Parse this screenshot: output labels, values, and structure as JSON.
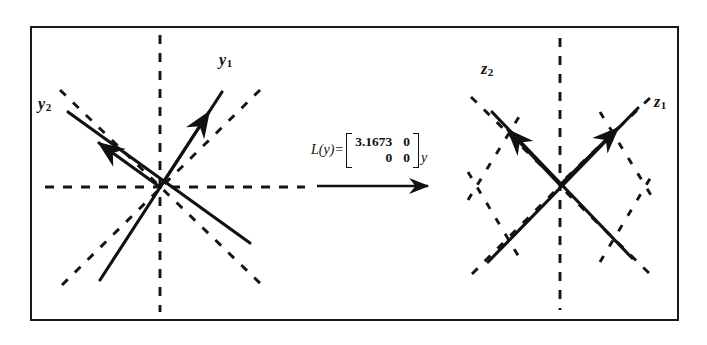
{
  "figure": {
    "type": "linear-transformation-diagram",
    "border_color": "#1a1a1a",
    "ink_color": "#111111"
  },
  "formula": {
    "function_label": "L(y)",
    "equals": "=",
    "matrix": [
      [
        "3.1673",
        "0"
      ],
      [
        "0",
        "0"
      ]
    ],
    "operand": "y"
  },
  "left_diagram": {
    "name": "y-space",
    "center": [
      160,
      187
    ],
    "labels": [
      {
        "id": "y1",
        "base": "y",
        "sub": "1",
        "x": 219,
        "y": 52
      },
      {
        "id": "y2",
        "base": "y",
        "sub": "2",
        "x": 38,
        "y": 96
      }
    ],
    "dashed_lines": [
      {
        "name": "horizontal-axis",
        "x1": 45,
        "y1": 187,
        "x2": 305,
        "y2": 187
      },
      {
        "name": "vertical-axis",
        "x1": 160,
        "y1": 35,
        "x2": 160,
        "y2": 312
      },
      {
        "name": "diagonal-up-right",
        "x1": 62,
        "y1": 285,
        "x2": 262,
        "y2": 88
      },
      {
        "name": "diagonal-up-left",
        "x1": 60,
        "y1": 90,
        "x2": 265,
        "y2": 288
      }
    ],
    "vectors": [
      {
        "name": "y1-vector",
        "x1": 160,
        "y1": 187,
        "x2": 222,
        "y2": 92,
        "arrow_at": [
          205,
          118
        ]
      },
      {
        "name": "y2-vector",
        "x1": 160,
        "y1": 187,
        "x2": 68,
        "y2": 112,
        "arrow_at": [
          95,
          134
        ]
      },
      {
        "name": "y1-vector-opposite",
        "x1": 160,
        "y1": 187,
        "x2": 100,
        "y2": 280
      },
      {
        "name": "y2-vector-opposite",
        "x1": 160,
        "y1": 187,
        "x2": 250,
        "y2": 243
      }
    ]
  },
  "right_diagram": {
    "name": "z-space",
    "center": [
      560,
      185
    ],
    "labels": [
      {
        "id": "z2",
        "base": "z",
        "sub": "2",
        "x": 481,
        "y": 61
      },
      {
        "id": "z1",
        "base": "z",
        "sub": "1",
        "x": 654,
        "y": 94
      }
    ],
    "dashed_lines": [
      {
        "name": "vertical-axis",
        "x1": 560,
        "y1": 38,
        "x2": 560,
        "y2": 310
      },
      {
        "name": "dashed-ray-ne",
        "x1": 560,
        "y1": 185,
        "x2": 655,
        "y2": 92
      },
      {
        "name": "dashed-ray-nw",
        "x1": 560,
        "y1": 185,
        "x2": 466,
        "y2": 92
      },
      {
        "name": "dashed-ray-se",
        "x1": 560,
        "y1": 185,
        "x2": 655,
        "y2": 280
      },
      {
        "name": "dashed-ray-sw",
        "x1": 560,
        "y1": 185,
        "x2": 466,
        "y2": 280
      },
      {
        "name": "dashed-chevron-upper-left",
        "x1": 470,
        "y1": 196,
        "x2": 524,
        "y2": 110
      },
      {
        "name": "dashed-chevron-upper-right",
        "x1": 600,
        "y1": 110,
        "x2": 652,
        "y2": 196
      },
      {
        "name": "dashed-chevron-lower-left",
        "x1": 470,
        "y1": 178,
        "x2": 524,
        "y2": 266
      },
      {
        "name": "dashed-chevron-lower-right",
        "x1": 600,
        "y1": 266,
        "x2": 652,
        "y2": 178
      }
    ],
    "vectors": [
      {
        "name": "z1-vector",
        "x1": 560,
        "y1": 185,
        "x2": 638,
        "y2": 108,
        "arrow_at": [
          614,
          132
        ]
      },
      {
        "name": "z2-vector",
        "x1": 560,
        "y1": 185,
        "x2": 492,
        "y2": 112,
        "arrow_at": [
          512,
          134
        ]
      },
      {
        "name": "z1-vector-opposite",
        "x1": 560,
        "y1": 185,
        "x2": 488,
        "y2": 262
      },
      {
        "name": "z2-vector-opposite",
        "x1": 560,
        "y1": 185,
        "x2": 628,
        "y2": 258
      }
    ]
  },
  "transform_arrow": {
    "name": "transformation-arrow",
    "x1": 317,
    "y1": 186,
    "x2": 432,
    "y2": 186
  }
}
